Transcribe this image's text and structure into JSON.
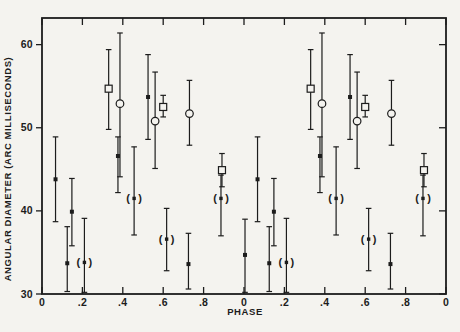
{
  "figure": {
    "xlabel": "PHASE",
    "ylabel": "ANGULAR DIAMETER (ARC MILLISECONDS)"
  },
  "chart_data": {
    "type": "scatter",
    "title": "",
    "xlabel": "PHASE",
    "ylabel": "ANGULAR DIAMETER (ARC MILLISECONDS)",
    "xlim": [
      0,
      2
    ],
    "ylim": [
      30,
      63.2
    ],
    "grid": false,
    "legend": "none",
    "paper_color": "#f4f3ef",
    "ink_color": "#1c1c1c",
    "x_ticks": [
      {
        "pos": 0.0,
        "label": "0"
      },
      {
        "pos": 0.2,
        "label": ".2"
      },
      {
        "pos": 0.4,
        "label": ".4"
      },
      {
        "pos": 0.6,
        "label": ".6"
      },
      {
        "pos": 0.8,
        "label": ".8"
      },
      {
        "pos": 1.0,
        "label": "0"
      },
      {
        "pos": 1.2,
        "label": ".2"
      },
      {
        "pos": 1.4,
        "label": ".4"
      },
      {
        "pos": 1.6,
        "label": ".6"
      },
      {
        "pos": 1.8,
        "label": ".8"
      },
      {
        "pos": 2.0,
        "label": "0"
      }
    ],
    "y_ticks": [
      {
        "pos": 30,
        "label": "30"
      },
      {
        "pos": 40,
        "label": "40"
      },
      {
        "pos": 50,
        "label": "50"
      },
      {
        "pos": 60,
        "label": "60"
      }
    ],
    "series": [
      {
        "name": "filled-square-points",
        "symbol": "filled-square",
        "points": [
          {
            "x": 0.067,
            "y": 43.8,
            "lo": 38.7,
            "hi": 48.9
          },
          {
            "x": 0.125,
            "y": 33.7,
            "lo": 30.3,
            "hi": 38.1
          },
          {
            "x": 0.148,
            "y": 39.9,
            "lo": 35.8,
            "hi": 43.9
          },
          {
            "x": 0.376,
            "y": 46.6,
            "lo": 42.2,
            "hi": 48.9
          },
          {
            "x": 0.525,
            "y": 53.7,
            "lo": 48.6,
            "hi": 58.8
          },
          {
            "x": 0.725,
            "y": 33.6,
            "lo": 30.6,
            "hi": 37.3
          },
          {
            "x": 1.005,
            "y": 34.7,
            "lo": 30.2,
            "hi": 39.0
          },
          {
            "x": 1.067,
            "y": 43.8,
            "lo": 38.7,
            "hi": 48.9
          },
          {
            "x": 1.125,
            "y": 33.7,
            "lo": 30.3,
            "hi": 38.1
          },
          {
            "x": 1.148,
            "y": 39.9,
            "lo": 35.8,
            "hi": 43.9
          },
          {
            "x": 1.376,
            "y": 46.6,
            "lo": 42.2,
            "hi": 48.9
          },
          {
            "x": 1.525,
            "y": 53.7,
            "lo": 48.6,
            "hi": 58.8
          },
          {
            "x": 1.725,
            "y": 33.6,
            "lo": 30.6,
            "hi": 37.3
          }
        ]
      },
      {
        "name": "open-circle-points",
        "symbol": "open-circle",
        "points": [
          {
            "x": 0.386,
            "y": 52.9,
            "lo": 44.1,
            "hi": 61.4
          },
          {
            "x": 0.56,
            "y": 50.8,
            "lo": 45.1,
            "hi": 56.7
          },
          {
            "x": 0.73,
            "y": 51.7,
            "lo": 47.9,
            "hi": 55.7
          },
          {
            "x": 1.386,
            "y": 52.9,
            "lo": 44.1,
            "hi": 61.4
          },
          {
            "x": 1.56,
            "y": 50.8,
            "lo": 45.1,
            "hi": 56.7
          },
          {
            "x": 1.73,
            "y": 51.7,
            "lo": 47.9,
            "hi": 55.7
          }
        ]
      },
      {
        "name": "open-square-points",
        "symbol": "open-square",
        "points": [
          {
            "x": 0.33,
            "y": 54.7,
            "lo": 49.8,
            "hi": 59.4
          },
          {
            "x": 0.6,
            "y": 52.5,
            "lo": 51.3,
            "hi": 53.9
          },
          {
            "x": 0.891,
            "y": 44.9,
            "lo": 42.9,
            "hi": 46.9
          },
          {
            "x": 1.33,
            "y": 54.7,
            "lo": 49.8,
            "hi": 59.4
          },
          {
            "x": 1.6,
            "y": 52.5,
            "lo": 51.3,
            "hi": 53.9
          },
          {
            "x": 1.891,
            "y": 44.9,
            "lo": 42.9,
            "hi": 46.9
          }
        ]
      },
      {
        "name": "parenthesized-points",
        "symbol": "paren-square",
        "points": [
          {
            "x": 0.21,
            "y": 33.8,
            "lo": 30.2,
            "hi": 39.1
          },
          {
            "x": 0.456,
            "y": 41.5,
            "lo": 37.1,
            "hi": 47.7
          },
          {
            "x": 0.617,
            "y": 36.6,
            "lo": 32.8,
            "hi": 40.3
          },
          {
            "x": 0.886,
            "y": 41.5,
            "lo": 37.0,
            "hi": 44.3
          },
          {
            "x": 1.21,
            "y": 33.8,
            "lo": 30.2,
            "hi": 39.1
          },
          {
            "x": 1.456,
            "y": 41.5,
            "lo": 37.1,
            "hi": 47.7
          },
          {
            "x": 1.617,
            "y": 36.6,
            "lo": 32.8,
            "hi": 40.3
          },
          {
            "x": 1.886,
            "y": 41.5,
            "lo": 37.0,
            "hi": 44.3
          }
        ]
      }
    ]
  }
}
